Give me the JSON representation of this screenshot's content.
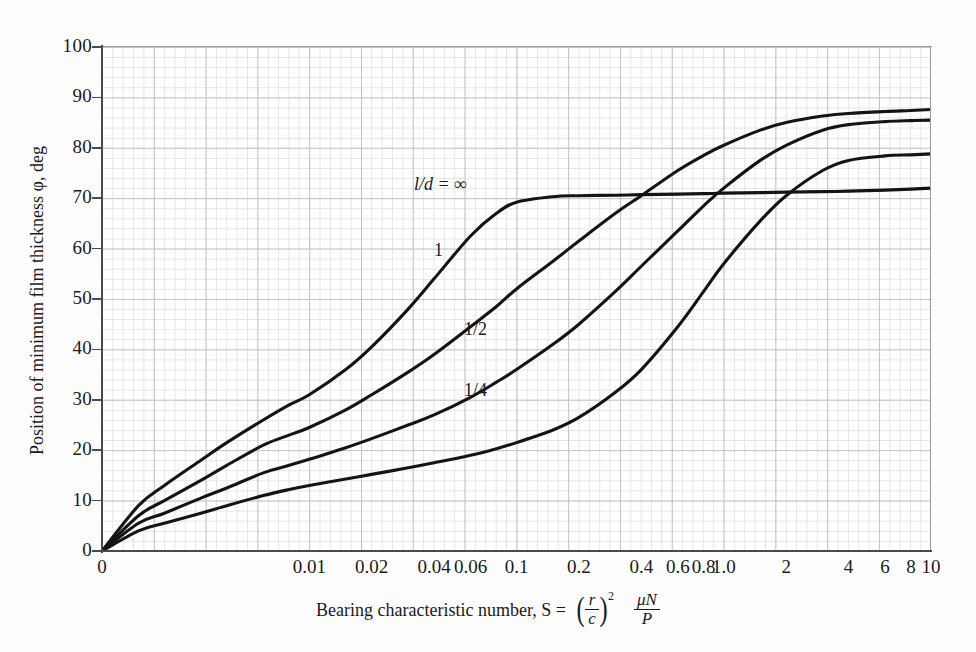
{
  "chart_data": {
    "type": "line",
    "title": "",
    "xlabel": "Bearing characteristic number, S = (r/c)² μN/P",
    "ylabel": "Position of minimum film thickness φ, deg",
    "xscale": "log",
    "xlim": [
      0.001,
      10
    ],
    "ylim": [
      0,
      100
    ],
    "grid": true,
    "legend_position": "inline-curve-labels",
    "x_tick_labels": [
      "0",
      "0.01",
      "0.02",
      "0.04",
      "0.06",
      "0.1",
      "0.2",
      "0.4",
      "0.6",
      "0.8",
      "1.0",
      "2",
      "4",
      "6",
      "8",
      "10"
    ],
    "x_tick_values": [
      0.001,
      0.01,
      0.02,
      0.04,
      0.06,
      0.1,
      0.2,
      0.4,
      0.6,
      0.8,
      1.0,
      2,
      4,
      6,
      8,
      10
    ],
    "y_tick_labels": [
      "0",
      "10",
      "20",
      "30",
      "40",
      "50",
      "60",
      "70",
      "80",
      "90",
      "100"
    ],
    "y_tick_values": [
      0,
      10,
      20,
      30,
      40,
      50,
      60,
      70,
      80,
      90,
      100
    ],
    "x": [
      0.001,
      0.0015,
      0.002,
      0.003,
      0.004,
      0.006,
      0.008,
      0.01,
      0.015,
      0.02,
      0.03,
      0.04,
      0.06,
      0.08,
      0.1,
      0.15,
      0.2,
      0.3,
      0.4,
      0.6,
      0.8,
      1.0,
      1.5,
      2,
      3,
      4,
      6,
      8,
      10
    ],
    "series": [
      {
        "name": "l/d = ∞",
        "label": "l/d = ∞",
        "values": [
          0,
          9,
          13,
          18,
          21.5,
          26,
          29,
          31,
          36,
          40.5,
          48,
          54,
          62.5,
          67,
          69.2,
          70.3,
          70.5,
          70.6,
          70.7,
          70.8,
          70.9,
          71.0,
          71.1,
          71.2,
          71.3,
          71.4,
          71.6,
          71.8,
          72.0
        ]
      },
      {
        "name": "l/d = 1",
        "label": "1",
        "values": [
          0,
          7,
          10,
          14,
          17,
          21,
          23,
          24.5,
          28,
          31,
          35.5,
          39,
          44.5,
          48.5,
          52,
          57.5,
          61.5,
          67,
          70.5,
          75.5,
          78.5,
          80.5,
          83.5,
          85,
          86.3,
          86.8,
          87.2,
          87.4,
          87.6
        ]
      },
      {
        "name": "l/d = 1/2",
        "label": "1/2",
        "values": [
          0,
          5.5,
          7.5,
          10.5,
          12.5,
          15.5,
          17,
          18.2,
          20.5,
          22.3,
          25,
          27,
          30.5,
          33.5,
          36,
          41,
          45,
          51.5,
          56.5,
          63.5,
          68.5,
          72,
          77.5,
          80.5,
          83.5,
          84.6,
          85.2,
          85.4,
          85.5
        ]
      },
      {
        "name": "l/d = 1/4",
        "label": "1/4",
        "values": [
          0,
          4,
          5.5,
          7.5,
          9,
          11,
          12.2,
          13,
          14.3,
          15.2,
          16.5,
          17.5,
          19,
          20.3,
          21.5,
          24,
          26.5,
          31.5,
          36,
          44.5,
          51.5,
          57,
          65.5,
          70.5,
          75.5,
          77.5,
          78.4,
          78.6,
          78.8
        ]
      }
    ],
    "annotations": [
      {
        "text": "l/d = ∞",
        "series": "l/d = ∞"
      },
      {
        "text": "1",
        "series": "l/d = 1"
      },
      {
        "text": "1/2",
        "series": "l/d = 1/2"
      },
      {
        "text": "1/4",
        "series": "l/d = 1/4"
      }
    ]
  },
  "axes": {
    "y_title": "Position of minimum film thickness φ, deg",
    "x_title_prefix": "Bearing characteristic number, S =",
    "x_formula": {
      "numerator1": "r",
      "denominator1": "c",
      "exponent": "2",
      "numerator2": "μN",
      "denominator2": "P"
    }
  },
  "colors": {
    "curve": "#141414",
    "grid_minor": "#dfe0e6",
    "grid_major": "#b9bcc6",
    "axis": "#4a4a4a",
    "background": "#ffffff"
  }
}
